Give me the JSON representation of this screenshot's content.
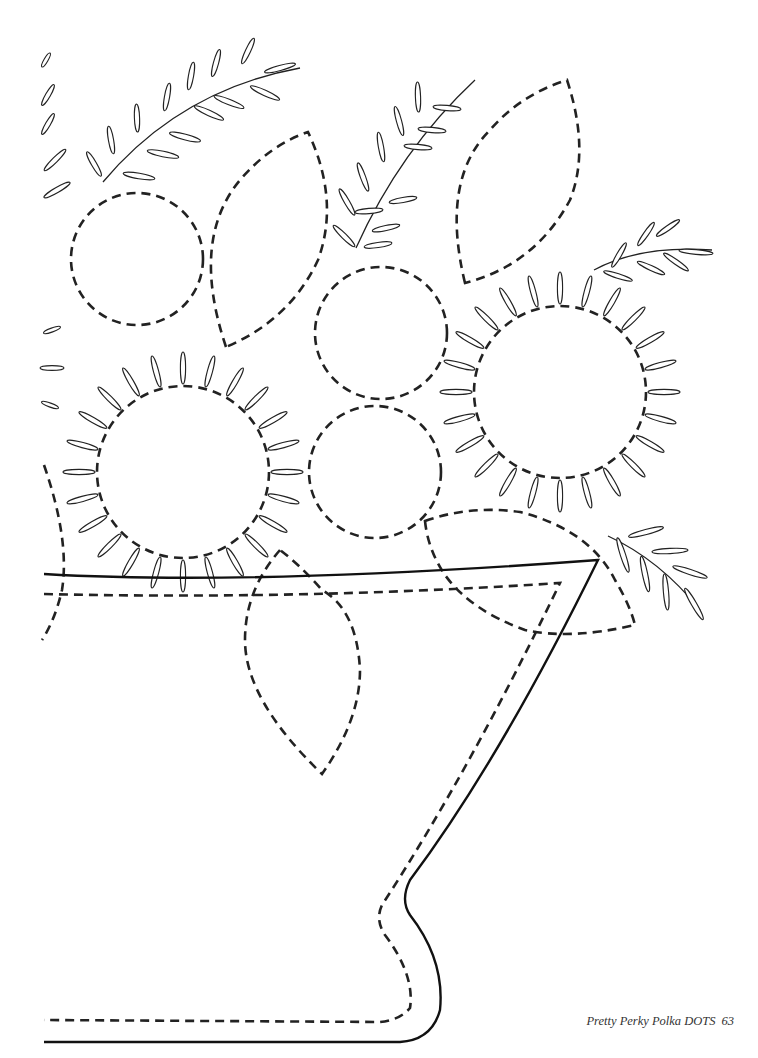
{
  "page": {
    "type": "quilt-applique-pattern",
    "footer": {
      "book_title": "Pretty Perky Polka DOTS",
      "page_number": "63"
    }
  },
  "pattern": {
    "elements": [
      "dashed-circle-top-left",
      "dashed-leaf-top-center",
      "dashed-leaf-top-right",
      "dashed-circle-center",
      "dashed-circle-center-lower",
      "sunflower-left",
      "sunflower-right",
      "fern-sprig-top-left",
      "fern-sprig-top-center",
      "fern-sprig-right",
      "fern-sprig-lower-right",
      "dashed-leaf-lower-center",
      "dashed-leaf-lower-right",
      "vase-outline"
    ],
    "colors": {
      "line": "#222222",
      "background": "#ffffff"
    }
  }
}
